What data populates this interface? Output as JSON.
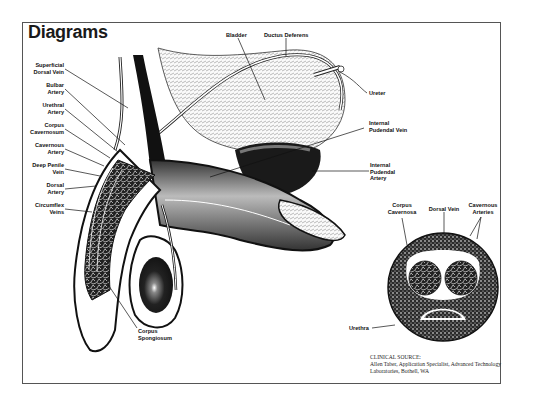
{
  "title": "Diagrams",
  "sagittal_labels": {
    "superficial_dorsal_vein": [
      "Superficial",
      "Dorsal Vein"
    ],
    "bulbar_artery": [
      "Bulbar",
      "Artery"
    ],
    "urethral_artery": [
      "Urethral",
      "Artery"
    ],
    "corpus_cavernosum": [
      "Corpus",
      "Cavernosum"
    ],
    "cavernous_artery": [
      "Cavernous",
      "Artery"
    ],
    "deep_penile_vein": [
      "Deep Penile",
      "Vein"
    ],
    "dorsal_artery": [
      "Dorsal",
      "Artery"
    ],
    "circumflex_veins": [
      "Circumflex",
      "Veins"
    ],
    "bladder": "Bladder",
    "ductus_deferens": "Ductus Deferens",
    "ureter": "Ureter",
    "internal_pudendal_vein": [
      "Internal",
      "Pudendal Vein"
    ],
    "internal_pudendal_artery": [
      "Internal",
      "Pudendal",
      "Artery"
    ],
    "corpus_spongiosum": [
      "Corpus",
      "Spongiosum"
    ]
  },
  "cross_section_labels": {
    "corpus_cavernosa": [
      "Corpus",
      "Cavernosa"
    ],
    "dorsal_vein": "Dorsal Vein",
    "cavernous_arteries": [
      "Cavernous",
      "Arteries"
    ],
    "urethra": "Urethra"
  },
  "source": {
    "heading": "CLINICAL SOURCE:",
    "line1": "Allen Taber, Application Specialist, Advanced Technology",
    "line2": "Laboratories, Bothell, WA"
  }
}
